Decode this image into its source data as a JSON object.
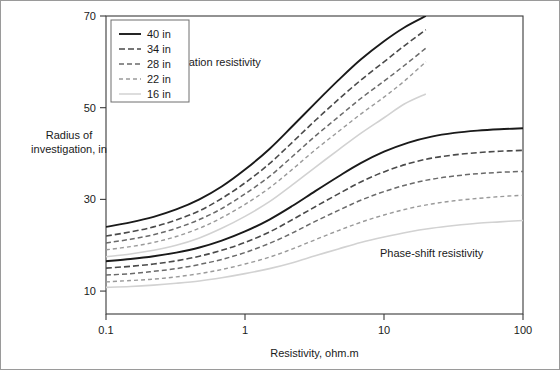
{
  "chart_data": {
    "type": "line",
    "title": "",
    "xlabel": "Resistivity, ohm.m",
    "ylabel": "Radius of investigation, in",
    "xscale": "log",
    "yscale": "linear",
    "xlim": [
      0.1,
      100
    ],
    "ylim": [
      5,
      70
    ],
    "xticks": [
      "0.1",
      "1",
      "10",
      "100"
    ],
    "xtick_values": [
      0.1,
      1,
      10,
      100
    ],
    "yticks": [
      "10",
      "30",
      "50",
      "70"
    ],
    "ytick_values": [
      10,
      30,
      50,
      70
    ],
    "grid": false,
    "legend_position": "top-left",
    "annotations": [
      {
        "text": "Attenuation resistivity",
        "x": 0.55,
        "y": 59
      },
      {
        "text": "Phase-shift resistivity",
        "x": 22,
        "y": 17.5
      }
    ],
    "legend_entries": [
      {
        "label": "40 in",
        "color": "#1a1a1a",
        "width": 1.9,
        "dash": "none"
      },
      {
        "label": "34 in",
        "color": "#4a4a4a",
        "width": 1.6,
        "dash": "6,3"
      },
      {
        "label": "28 in",
        "color": "#6a6a6a",
        "width": 1.5,
        "dash": "5,3"
      },
      {
        "label": "22 in",
        "color": "#9a9a9a",
        "width": 1.4,
        "dash": "4,3"
      },
      {
        "label": "16 in",
        "color": "#d2d2d2",
        "width": 1.5,
        "dash": "none"
      }
    ],
    "groups": [
      {
        "name": "Attenuation resistivity",
        "series": [
          {
            "name": "40 in",
            "color": "#1a1a1a",
            "width": 1.9,
            "dash": "none",
            "x": [
              0.1,
              0.15,
              0.22,
              0.32,
              0.47,
              0.68,
              1.0,
              1.5,
              2.2,
              3.2,
              4.7,
              6.8,
              10.0,
              14.0,
              20.0
            ],
            "y": [
              24.0,
              25.0,
              26.2,
              27.8,
              30.0,
              32.8,
              36.5,
              41.0,
              46.0,
              51.0,
              56.0,
              60.5,
              64.5,
              67.5,
              70.0
            ]
          },
          {
            "name": "34 in",
            "color": "#4a4a4a",
            "width": 1.6,
            "dash": "6,3",
            "x": [
              0.1,
              0.15,
              0.22,
              0.32,
              0.47,
              0.68,
              1.0,
              1.5,
              2.2,
              3.2,
              4.7,
              6.8,
              10.0,
              14.0,
              20.0
            ],
            "y": [
              22.0,
              22.9,
              24.0,
              25.5,
              27.5,
              30.2,
              33.6,
              37.8,
              42.5,
              47.2,
              51.8,
              56.0,
              60.0,
              63.5,
              67.0
            ]
          },
          {
            "name": "28 in",
            "color": "#6a6a6a",
            "width": 1.5,
            "dash": "5,3",
            "x": [
              0.1,
              0.15,
              0.22,
              0.32,
              0.47,
              0.68,
              1.0,
              1.5,
              2.2,
              3.2,
              4.7,
              6.8,
              10.0,
              14.0,
              20.0
            ],
            "y": [
              20.5,
              21.3,
              22.3,
              23.7,
              25.6,
              28.0,
              31.2,
              35.0,
              39.4,
              43.8,
              48.0,
              52.0,
              55.8,
              59.2,
              63.0
            ]
          },
          {
            "name": "22 in",
            "color": "#9a9a9a",
            "width": 1.4,
            "dash": "4,3",
            "x": [
              0.1,
              0.15,
              0.22,
              0.32,
              0.47,
              0.68,
              1.0,
              1.5,
              2.2,
              3.2,
              4.7,
              6.8,
              10.0,
              14.0,
              20.0
            ],
            "y": [
              19.0,
              19.7,
              20.6,
              21.9,
              23.7,
              26.0,
              28.9,
              32.5,
              36.6,
              40.8,
              44.8,
              48.6,
              52.3,
              55.8,
              60.0
            ]
          },
          {
            "name": "16 in",
            "color": "#d2d2d2",
            "width": 1.6,
            "dash": "none",
            "x": [
              0.1,
              0.15,
              0.22,
              0.32,
              0.47,
              0.68,
              1.0,
              1.5,
              2.2,
              3.2,
              4.7,
              6.8,
              10.0,
              14.0,
              20.0
            ],
            "y": [
              17.5,
              18.1,
              18.9,
              20.0,
              21.6,
              23.7,
              26.3,
              29.5,
              33.2,
              37.0,
              40.8,
              44.4,
              47.8,
              50.8,
              53.0
            ]
          }
        ]
      },
      {
        "name": "Phase-shift resistivity",
        "series": [
          {
            "name": "40 in",
            "color": "#1a1a1a",
            "width": 1.9,
            "dash": "none",
            "x": [
              0.1,
              0.15,
              0.22,
              0.32,
              0.47,
              0.68,
              1.0,
              1.5,
              2.2,
              3.2,
              4.7,
              6.8,
              10.0,
              15.0,
              22.0,
              32.0,
              47.0,
              68.0,
              100.0
            ],
            "y": [
              16.5,
              17.0,
              17.6,
              18.4,
              19.5,
              21.0,
              23.0,
              25.6,
              28.6,
              31.8,
              35.0,
              37.9,
              40.4,
              42.4,
              43.7,
              44.5,
              45.0,
              45.3,
              45.5
            ]
          },
          {
            "name": "34 in",
            "color": "#4a4a4a",
            "width": 1.6,
            "dash": "6,3",
            "x": [
              0.1,
              0.15,
              0.22,
              0.32,
              0.47,
              0.68,
              1.0,
              1.5,
              2.2,
              3.2,
              4.7,
              6.8,
              10.0,
              15.0,
              22.0,
              32.0,
              47.0,
              68.0,
              100.0
            ],
            "y": [
              15.0,
              15.4,
              15.9,
              16.6,
              17.6,
              18.9,
              20.6,
              22.9,
              25.6,
              28.4,
              31.2,
              33.8,
              36.0,
              37.8,
              39.0,
              39.7,
              40.2,
              40.5,
              40.7
            ]
          },
          {
            "name": "28 in",
            "color": "#6a6a6a",
            "width": 1.5,
            "dash": "5,3",
            "x": [
              0.1,
              0.15,
              0.22,
              0.32,
              0.47,
              0.68,
              1.0,
              1.5,
              2.2,
              3.2,
              4.7,
              6.8,
              10.0,
              15.0,
              22.0,
              32.0,
              47.0,
              68.0,
              100.0
            ],
            "y": [
              13.5,
              13.8,
              14.3,
              14.9,
              15.8,
              16.9,
              18.4,
              20.4,
              22.7,
              25.2,
              27.6,
              29.8,
              31.7,
              33.3,
              34.4,
              35.1,
              35.6,
              35.9,
              36.1
            ]
          },
          {
            "name": "22 in",
            "color": "#9a9a9a",
            "width": 1.4,
            "dash": "4,3",
            "x": [
              0.1,
              0.15,
              0.22,
              0.32,
              0.47,
              0.68,
              1.0,
              1.5,
              2.2,
              3.2,
              4.7,
              6.8,
              10.0,
              15.0,
              22.0,
              32.0,
              47.0,
              68.0,
              100.0
            ],
            "y": [
              12.0,
              12.3,
              12.6,
              13.1,
              13.8,
              14.7,
              15.9,
              17.4,
              19.2,
              21.2,
              23.2,
              25.0,
              26.6,
              28.0,
              29.0,
              29.7,
              30.2,
              30.6,
              30.9
            ]
          },
          {
            "name": "16 in",
            "color": "#d2d2d2",
            "width": 1.6,
            "dash": "none",
            "x": [
              0.1,
              0.15,
              0.22,
              0.32,
              0.47,
              0.68,
              1.0,
              1.5,
              2.2,
              3.2,
              4.7,
              6.8,
              10.0,
              15.0,
              22.0,
              32.0,
              47.0,
              68.0,
              100.0
            ],
            "y": [
              10.8,
              11.0,
              11.3,
              11.7,
              12.2,
              12.9,
              13.8,
              14.9,
              16.2,
              17.7,
              19.2,
              20.6,
              21.8,
              22.9,
              23.7,
              24.3,
              24.8,
              25.1,
              25.4
            ]
          }
        ]
      }
    ]
  }
}
